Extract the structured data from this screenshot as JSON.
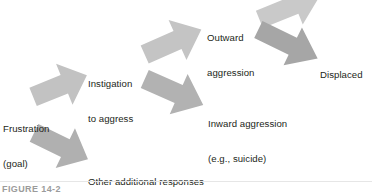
{
  "figure": {
    "caption": "FIGURE 14-2",
    "background_color": "#ffffff",
    "text_color": "#231f20",
    "arrow_light_color": "#c9c9c9",
    "arrow_mid_color": "#b4b4b4",
    "arrow_dark_color": "#a3a3a3"
  },
  "nodes": [
    {
      "id": "frustration",
      "line1": "Frustration",
      "line2": "(goal)"
    },
    {
      "id": "instigation",
      "line1": "Instigation",
      "line2": "to aggress"
    },
    {
      "id": "other-responses",
      "line1": "Other additional responses",
      "line2": "(e.g., withdrawal)"
    },
    {
      "id": "outward-aggression",
      "line1": "Outward",
      "line2": "aggression"
    },
    {
      "id": "inward-aggression",
      "line1": "Inward aggression",
      "line2": "(e.g., suicide)"
    },
    {
      "id": "displaced",
      "line1": "Displaced",
      "line2": ""
    }
  ],
  "arrows": [
    {
      "id": "frustration-to-instigation",
      "direction": "up-right",
      "shade": "#c2c2c2"
    },
    {
      "id": "frustration-to-other-responses",
      "direction": "down-right",
      "shade": "#b0b0b0"
    },
    {
      "id": "instigation-to-outward",
      "direction": "up-right",
      "shade": "#c4c4c4"
    },
    {
      "id": "instigation-to-inward",
      "direction": "down-right",
      "shade": "#b2b2b2"
    },
    {
      "id": "outward-upper",
      "direction": "up-right",
      "shade": "#c9c9c9"
    },
    {
      "id": "outward-to-displaced",
      "direction": "down-right",
      "shade": "#a6a6a6"
    }
  ]
}
